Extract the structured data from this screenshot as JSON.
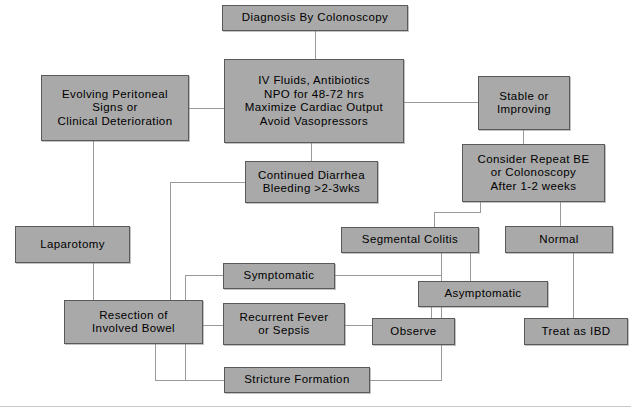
{
  "diagram": {
    "type": "flowchart",
    "canvas": {
      "width": 631,
      "height": 419,
      "background": "#ffffff"
    },
    "style": {
      "node_fill": "#a9a9a9",
      "node_border": "#5a5a5a",
      "edge_color": "#9a9a9a",
      "text_color": "#000000"
    },
    "nodes": [
      {
        "id": "diagnosis",
        "label": "Diagnosis By Colonoscopy"
      },
      {
        "id": "treatment",
        "label": "IV Fluids, Antibiotics\nNPO for 48-72 hrs\nMaximize Cardiac Output\nAvoid Vasopressors"
      },
      {
        "id": "peritoneal",
        "label": "Evolving Peritoneal\nSigns or\nClinical Deterioration"
      },
      {
        "id": "stable",
        "label": "Stable or\nImproving"
      },
      {
        "id": "repeat",
        "label": "Consider Repeat BE\nor Colonoscopy\nAfter 1-2 weeks"
      },
      {
        "id": "diarrhea",
        "label": "Continued Diarrhea\nBleeding >2-3wks"
      },
      {
        "id": "laparotomy",
        "label": "Laparotomy"
      },
      {
        "id": "segmental",
        "label": "Segmental Colitis"
      },
      {
        "id": "normal",
        "label": "Normal"
      },
      {
        "id": "symptomatic",
        "label": "Symptomatic"
      },
      {
        "id": "resection",
        "label": "Resection of\nInvolved Bowel"
      },
      {
        "id": "recurrent",
        "label": "Recurrent Fever\nor Sepsis"
      },
      {
        "id": "asymptomatic",
        "label": "Asymptomatic"
      },
      {
        "id": "observe",
        "label": "Observe"
      },
      {
        "id": "treatibd",
        "label": "Treat as IBD"
      },
      {
        "id": "stricture",
        "label": "Stricture Formation"
      }
    ],
    "edges": [
      "diagnosis -> treatment",
      "treatment -> peritoneal",
      "treatment -> stable",
      "treatment -> diarrhea",
      "stable -> repeat",
      "peritoneal -> laparotomy",
      "laparotomy -> resection",
      "repeat -> segmental",
      "repeat -> normal",
      "diarrhea -> resection",
      "segmental -> symptomatic",
      "segmental -> recurrent",
      "segmental -> stricture",
      "segmental -> asymptomatic",
      "symptomatic -> resection",
      "recurrent -> resection",
      "stricture -> resection",
      "asymptomatic -> observe",
      "normal -> treatibd"
    ]
  }
}
